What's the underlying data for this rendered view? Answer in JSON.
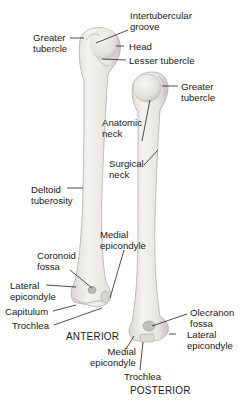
{
  "diagram": {
    "views": {
      "anterior": "ANTERIOR",
      "posterior": "POSTERIOR"
    },
    "anterior_labels": {
      "greater_tubercle": "Greater\ntubercle",
      "intertubercular_groove": "Intertubercular\ngroove",
      "head": "Head",
      "lesser_tubercle": "Lesser tubercle",
      "deltoid_tuberosity": "Deltoid\ntuberosity",
      "coronoid_fossa": "Coronoid\nfossa",
      "medial_epicondyle": "Medial\nepicondyle",
      "lateral_epicondyle": "Lateral\nepicondyle",
      "capitulum": "Capitulum",
      "trochlea": "Trochlea"
    },
    "posterior_labels": {
      "greater_tubercle": "Greater\ntubercle",
      "anatomic_neck": "Anatomic\nneck",
      "surgical_neck": "Surgical\nneck",
      "olecranon_fossa": "Olecranon\nfossa",
      "lateral_epicondyle": "Lateral\nepicondyle",
      "medial_epicondyle": "Medial\nepicondyle",
      "trochlea": "Trochlea"
    },
    "colors": {
      "bone_fill": "#ecebe6",
      "bone_shade": "#c9c7c0",
      "bone_outline": "#a8a69f",
      "leader_line": "#222222"
    }
  }
}
